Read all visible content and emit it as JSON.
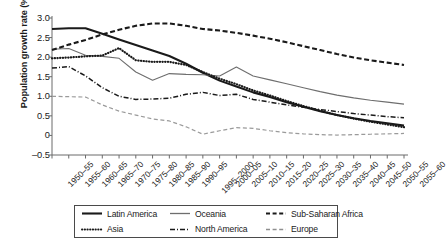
{
  "chart_data": {
    "type": "line",
    "title": "",
    "xlabel": "",
    "ylabel": "Population growth rate (%)",
    "ylim": [
      -0.5,
      3.0
    ],
    "yticks": [
      "3.0",
      "2.5",
      "2.0",
      "1.5",
      "1.0",
      "0.5",
      "0",
      "-0.5"
    ],
    "ytick_values": [
      3.0,
      2.5,
      2.0,
      1.5,
      1.0,
      0.5,
      0.0,
      -0.5
    ],
    "grid": false,
    "legend_position": "below",
    "categories": [
      "1950–55",
      "1955–60",
      "1960–65",
      "1965–70",
      "1970–75",
      "1975–80",
      "1980–85",
      "1985–90",
      "1990–95",
      "1995–2000",
      "2000–05",
      "2005–10",
      "2010–15",
      "2015–20",
      "2020–25",
      "2025–30",
      "2030–35",
      "2035–40",
      "2040–45",
      "2045–50",
      "2050–55",
      "2055–60"
    ],
    "series": [
      {
        "name": "Latin America",
        "style": "solid",
        "color": "#1a1a1a",
        "width": 2.1,
        "values": [
          2.72,
          2.74,
          2.74,
          2.6,
          2.45,
          2.31,
          2.17,
          2.03,
          1.83,
          1.6,
          1.4,
          1.25,
          1.1,
          0.98,
          0.85,
          0.73,
          0.62,
          0.52,
          0.44,
          0.37,
          0.31,
          0.25
        ]
      },
      {
        "name": "Oceania",
        "style": "solid",
        "color": "#6e6e6e",
        "width": 1.1,
        "values": [
          2.2,
          2.22,
          2.05,
          2.02,
          1.97,
          1.62,
          1.41,
          1.58,
          1.56,
          1.55,
          1.52,
          1.75,
          1.52,
          1.42,
          1.32,
          1.22,
          1.12,
          1.03,
          0.96,
          0.9,
          0.85,
          0.8
        ]
      },
      {
        "name": "Sub-Saharan Africa",
        "style": "dashed",
        "color": "#1a1a1a",
        "width": 2.1,
        "values": [
          2.18,
          2.32,
          2.44,
          2.58,
          2.7,
          2.8,
          2.86,
          2.86,
          2.8,
          2.72,
          2.68,
          2.62,
          2.55,
          2.47,
          2.38,
          2.28,
          2.18,
          2.08,
          1.99,
          1.92,
          1.86,
          1.8
        ]
      },
      {
        "name": "Asia",
        "style": "dotted",
        "color": "#1a1a1a",
        "width": 2.2,
        "values": [
          1.97,
          1.99,
          2.02,
          2.04,
          2.23,
          1.92,
          1.88,
          1.88,
          1.8,
          1.62,
          1.45,
          1.31,
          1.15,
          1.02,
          0.88,
          0.75,
          0.63,
          0.52,
          0.43,
          0.35,
          0.28,
          0.21
        ]
      },
      {
        "name": "North America",
        "style": "dashdot",
        "color": "#1a1a1a",
        "width": 1.5,
        "values": [
          1.72,
          1.76,
          1.52,
          1.22,
          1.0,
          0.92,
          0.93,
          0.95,
          1.05,
          1.1,
          1.02,
          1.05,
          0.92,
          0.85,
          0.78,
          0.72,
          0.66,
          0.61,
          0.56,
          0.52,
          0.48,
          0.45
        ]
      },
      {
        "name": "Europe",
        "style": "dashed",
        "color": "#9a9a9a",
        "width": 1.2,
        "values": [
          1.0,
          0.99,
          0.98,
          0.78,
          0.62,
          0.52,
          0.42,
          0.37,
          0.22,
          0.03,
          0.12,
          0.2,
          0.18,
          0.12,
          0.07,
          0.04,
          0.02,
          0.01,
          0.02,
          0.03,
          0.04,
          0.05
        ]
      }
    ]
  },
  "legend": {
    "items": [
      {
        "label": "Latin America",
        "style": "solid",
        "color": "#1a1a1a",
        "width": 2.1
      },
      {
        "label": "Oceania",
        "style": "solid",
        "color": "#6e6e6e",
        "width": 1.3
      },
      {
        "label": "Sub-Saharan Africa",
        "style": "dashed",
        "color": "#1a1a1a",
        "width": 1.8
      },
      {
        "label": "Asia",
        "style": "dotted",
        "color": "#1a1a1a",
        "width": 2.0
      },
      {
        "label": "North America",
        "style": "dashdot",
        "color": "#1a1a1a",
        "width": 1.5
      },
      {
        "label": "Europe",
        "style": "dashed",
        "color": "#8f8f8f",
        "width": 1.3
      }
    ]
  },
  "axes": {
    "axis_color": "#6a6a6a"
  }
}
